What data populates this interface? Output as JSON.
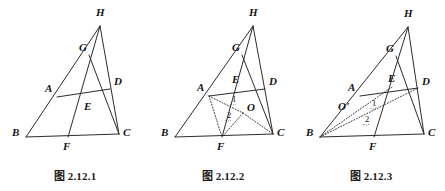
{
  "plate": {
    "background_color": "#ffffff",
    "ink_color": "#2b2b2b",
    "kind": "geometry-figure-plate",
    "figure_count": 3
  },
  "figures": [
    {
      "id": "fig-2-12-1",
      "caption": "图 2.12.1",
      "points": [
        {
          "key": "H",
          "label": "H",
          "x": 100,
          "y": 26,
          "label_x": 96,
          "label_y": 16
        },
        {
          "key": "G",
          "label": "G",
          "x": 89,
          "y": 55,
          "label_x": 79,
          "label_y": 51
        },
        {
          "key": "A",
          "label": "A",
          "x": 57,
          "y": 97,
          "label_x": 45,
          "label_y": 92
        },
        {
          "key": "D",
          "label": "D",
          "x": 110,
          "y": 89,
          "label_x": 114,
          "label_y": 85
        },
        {
          "key": "E",
          "label": "E",
          "x": 85,
          "y": 100,
          "label_x": 84,
          "label_y": 110
        },
        {
          "key": "B",
          "label": "B",
          "x": 26,
          "y": 137,
          "label_x": 12,
          "label_y": 136
        },
        {
          "key": "F",
          "label": "F",
          "x": 68,
          "y": 137,
          "label_x": 63,
          "label_y": 150
        },
        {
          "key": "C",
          "label": "C",
          "x": 119,
          "y": 134,
          "label_x": 123,
          "label_y": 136
        }
      ],
      "solid_segments": [
        [
          "B",
          "H"
        ],
        [
          "H",
          "C"
        ],
        [
          "B",
          "C"
        ],
        [
          "H",
          "F"
        ],
        [
          "A",
          "D"
        ],
        [
          "G",
          "C"
        ]
      ],
      "dotted_segments": [],
      "angle_labels": []
    },
    {
      "id": "fig-2-12-2",
      "caption": "图 2.12.2",
      "points": [
        {
          "key": "H",
          "label": "H",
          "x": 105,
          "y": 26,
          "label_x": 101,
          "label_y": 16
        },
        {
          "key": "G",
          "label": "G",
          "x": 94,
          "y": 55,
          "label_x": 84,
          "label_y": 51
        },
        {
          "key": "A",
          "label": "A",
          "x": 61,
          "y": 96,
          "label_x": 49,
          "label_y": 91
        },
        {
          "key": "E",
          "label": "E",
          "x": 88,
          "y": 88,
          "label_x": 84,
          "label_y": 83
        },
        {
          "key": "D",
          "label": "D",
          "x": 117,
          "y": 89,
          "label_x": 121,
          "label_y": 85
        },
        {
          "key": "O",
          "label": "O",
          "x": 95,
          "y": 113,
          "label_x": 99,
          "label_y": 111
        },
        {
          "key": "B",
          "label": "B",
          "x": 27,
          "y": 137,
          "label_x": 13,
          "label_y": 136
        },
        {
          "key": "F",
          "label": "F",
          "x": 74,
          "y": 137,
          "label_x": 69,
          "label_y": 150
        },
        {
          "key": "C",
          "label": "C",
          "x": 125,
          "y": 134,
          "label_x": 129,
          "label_y": 136
        }
      ],
      "solid_segments": [
        [
          "B",
          "H"
        ],
        [
          "H",
          "C"
        ],
        [
          "B",
          "C"
        ],
        [
          "H",
          "F"
        ],
        [
          "A",
          "D"
        ],
        [
          "G",
          "C"
        ]
      ],
      "dotted_segments": [
        [
          "A",
          "O"
        ],
        [
          "O",
          "C"
        ],
        [
          "O",
          "F"
        ],
        [
          "A",
          "F"
        ]
      ],
      "angle_labels": [
        {
          "text": "1",
          "x": 84,
          "y": 102
        },
        {
          "text": "2",
          "x": 79,
          "y": 118
        }
      ]
    },
    {
      "id": "fig-2-12-3",
      "caption": "图 2.12.3",
      "points": [
        {
          "key": "H",
          "label": "H",
          "x": 112,
          "y": 27,
          "label_x": 108,
          "label_y": 17
        },
        {
          "key": "G",
          "label": "G",
          "x": 100,
          "y": 56,
          "label_x": 90,
          "label_y": 52
        },
        {
          "key": "A",
          "label": "A",
          "x": 64,
          "y": 96,
          "label_x": 52,
          "label_y": 91
        },
        {
          "key": "E",
          "label": "E",
          "x": 96,
          "y": 87,
          "label_x": 92,
          "label_y": 82
        },
        {
          "key": "D",
          "label": "D",
          "x": 122,
          "y": 88,
          "label_x": 126,
          "label_y": 85
        },
        {
          "key": "O1",
          "label": "O'",
          "x": 55,
          "y": 106,
          "label_x": 42,
          "label_y": 110
        },
        {
          "key": "B",
          "label": "B",
          "x": 24,
          "y": 137,
          "label_x": 10,
          "label_y": 136
        },
        {
          "key": "F",
          "label": "F",
          "x": 78,
          "y": 137,
          "label_x": 73,
          "label_y": 150
        },
        {
          "key": "C",
          "label": "C",
          "x": 128,
          "y": 134,
          "label_x": 132,
          "label_y": 136
        }
      ],
      "solid_segments": [
        [
          "B",
          "H"
        ],
        [
          "H",
          "C"
        ],
        [
          "B",
          "C"
        ],
        [
          "H",
          "F"
        ],
        [
          "A",
          "D"
        ],
        [
          "G",
          "C"
        ]
      ],
      "dotted_segments": [
        [
          "B",
          "D"
        ],
        [
          "B",
          "E"
        ]
      ],
      "angle_labels": [
        {
          "text": "1",
          "x": 76,
          "y": 106
        },
        {
          "text": "2",
          "x": 69,
          "y": 122
        }
      ]
    }
  ]
}
